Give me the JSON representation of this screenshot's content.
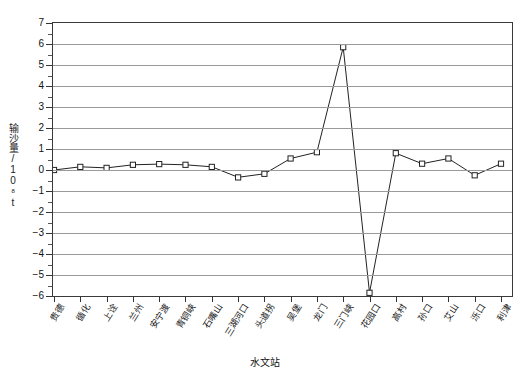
{
  "chart_data": {
    "type": "line",
    "title": "",
    "xlabel": "水文站",
    "ylabel": "输沙量/10⁸t",
    "ylabel_main": "输沙量/10",
    "ylabel_sup": "8",
    "ylabel_unit": "t",
    "ylim": [
      -6,
      7
    ],
    "yticks": [
      7,
      6,
      5,
      4,
      3,
      2,
      1,
      0,
      -1,
      -2,
      -3,
      -4,
      -5,
      -6
    ],
    "ytick_labels": [
      "7",
      "6",
      "5",
      "4",
      "3",
      "2",
      "1",
      "0",
      "−1",
      "−2",
      "−3",
      "−4",
      "−5",
      "−6"
    ],
    "grid": true,
    "grid_axis": "y",
    "legend": "none",
    "minor_ticks_y": true,
    "categories": [
      "贵德",
      "循化",
      "上诠",
      "兰州",
      "安宁渡",
      "青铜峡",
      "石嘴山",
      "三湖河口",
      "头道拐",
      "吴堡",
      "龙门",
      "三门峡",
      "花园口",
      "高村",
      "孙口",
      "艾山",
      "泺口",
      "利津"
    ],
    "series": [
      {
        "name": "输沙量",
        "marker": "open-square",
        "values": [
          0.0,
          0.15,
          0.1,
          0.25,
          0.28,
          0.25,
          0.15,
          -0.35,
          -0.18,
          0.55,
          0.85,
          5.85,
          -5.85,
          0.8,
          0.3,
          0.55,
          -0.25,
          0.3
        ]
      }
    ],
    "colors": {
      "line": "#222222",
      "marker_fill": "#ffffff",
      "marker_stroke": "#222222",
      "grid": "#9a9a9a",
      "axis": "#3a3a3a"
    }
  },
  "caption_fragment": ""
}
